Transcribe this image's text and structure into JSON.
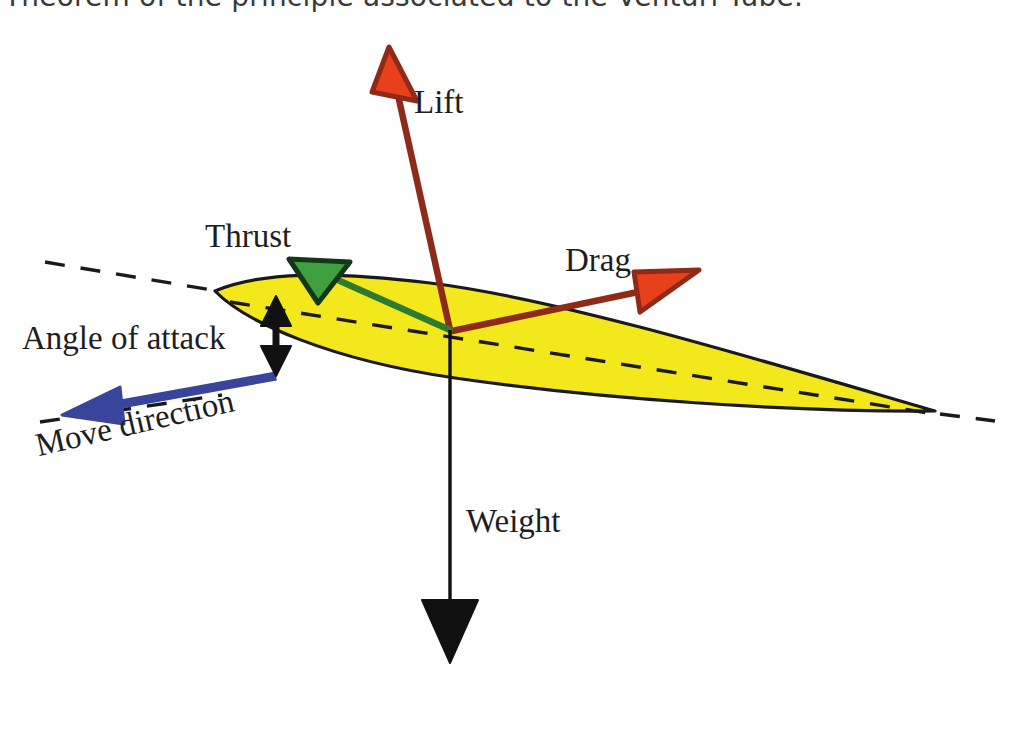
{
  "heading": {
    "text": "Theorem of the principle associated to the Venturi Tube."
  },
  "diagram": {
    "labels": {
      "lift": "Lift",
      "drag": "Drag",
      "thrust": "Thrust",
      "weight": "Weight",
      "angle_of_attack": "Angle of attack",
      "move_direction": "Move direction"
    },
    "colors": {
      "airfoil_fill": "#F2E81C",
      "airfoil_stroke": "#1a1a1a",
      "lift_arrow_fill": "#E8401A",
      "lift_arrow_stroke": "#8F2A18",
      "drag_arrow_fill": "#E8401A",
      "drag_arrow_stroke": "#8F2A18",
      "thrust_arrow_fill": "#3FA03F",
      "thrust_arrow_stroke": "#16361A",
      "weight_arrow": "#111111",
      "move_direction_arrow": "#39459A",
      "angle_arrow": "#111111",
      "chord_dash": "#1a1a1a",
      "background": "#FFFFFF",
      "text": "#1e1e22"
    },
    "forces": [
      {
        "name": "lift",
        "label": "Lift",
        "direction": "up, slightly left",
        "color": "#E8401A"
      },
      {
        "name": "drag",
        "label": "Drag",
        "direction": "up-right (rearward)",
        "color": "#E8401A"
      },
      {
        "name": "thrust",
        "label": "Thrust",
        "direction": "up-left (forward)",
        "color": "#3FA03F"
      },
      {
        "name": "weight",
        "label": "Weight",
        "direction": "straight down",
        "color": "#111111"
      },
      {
        "name": "move-direction",
        "label": "Move direction",
        "direction": "down-left",
        "color": "#39459A"
      }
    ],
    "annotations": [
      {
        "name": "angle-of-attack",
        "label": "Angle of attack",
        "type": "double-headed-vertical-arrow"
      },
      {
        "name": "relative-wind-reference-line",
        "type": "dashed-line"
      },
      {
        "name": "chord-line",
        "type": "dashed-line"
      }
    ]
  }
}
